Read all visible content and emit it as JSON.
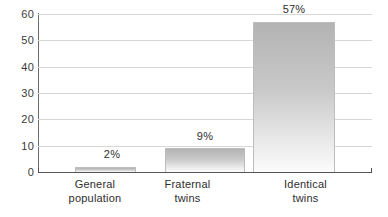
{
  "chart_data": {
    "type": "bar",
    "title": "",
    "subtitle": "",
    "xlabel": "",
    "ylabel": "",
    "ylim": [
      0,
      60
    ],
    "yticks": [
      "0",
      "10",
      "20",
      "30",
      "40",
      "50",
      "60"
    ],
    "grid": true,
    "legend": "none",
    "categories": [
      "General population",
      "Fraternal twins",
      "Identical twins"
    ],
    "category_lines": [
      {
        "line1": "General",
        "line2": "population"
      },
      {
        "line1": "Fraternal",
        "line2": "twins"
      },
      {
        "line1": "Identical",
        "line2": "twins"
      }
    ],
    "values": [
      2,
      9,
      57
    ],
    "value_labels": [
      "2%",
      "9%",
      "57%"
    ],
    "colors": {
      "bar_top": "#b3b3b3",
      "bar_bottom": "#fbfbfb",
      "bar_border": "#bdbdbd",
      "gridline": "#d8d8d8",
      "axis": "#555555",
      "text": "#2e2e2e",
      "background": "#ffffff"
    }
  }
}
